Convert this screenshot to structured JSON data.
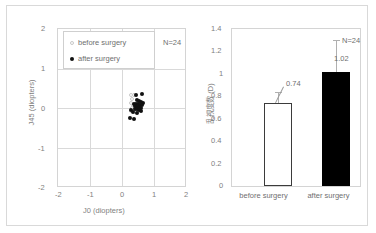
{
  "figure": {
    "border_color": "#d9d9d9"
  },
  "scatter": {
    "xlabel": "J0 (diopters)",
    "ylabel": "J45 (diopters)",
    "annotation": "N=24",
    "xticks": [
      "-2",
      "-1",
      "0",
      "1",
      "2"
    ],
    "yticks": [
      "2",
      "1",
      "0",
      "-1",
      "-2"
    ],
    "legend": [
      {
        "label": "before surgery",
        "marker": "open-circle-marker"
      },
      {
        "label": "after surgery",
        "marker": "filled-circle-marker"
      }
    ]
  },
  "bar": {
    "ylabel": "乱視度数 (D)",
    "yticks": [
      "1.4",
      "1.2",
      "1",
      "0.8",
      "0.6",
      "0.4",
      "0.2",
      "0"
    ],
    "annotation": "N=24",
    "categories": [
      "before surgery",
      "after surgery"
    ],
    "value_labels": [
      "0.74",
      "1.02"
    ]
  },
  "chart_data": [
    {
      "type": "scatter",
      "title": "",
      "xlabel": "J0 (diopters)",
      "ylabel": "J45 (diopters)",
      "xlim": [
        -2,
        2
      ],
      "ylim": [
        -2,
        2
      ],
      "xticks": [
        -2,
        -1,
        0,
        1,
        2
      ],
      "yticks": [
        -2,
        -1,
        0,
        1,
        2
      ],
      "grid": true,
      "legend_position": "upper-left",
      "annotations": [
        "N=24"
      ],
      "series": [
        {
          "name": "before surgery",
          "marker": "open-circle",
          "color": "#ffffff",
          "edge_color": "#c8c8c8",
          "points": [
            [
              0.3,
              0.33
            ],
            [
              0.38,
              0.33
            ],
            [
              0.33,
              0.22
            ],
            [
              0.3,
              0.11
            ],
            [
              0.36,
              0.05
            ],
            [
              0.42,
              0.02
            ],
            [
              0.34,
              -0.02
            ],
            [
              0.4,
              -0.06
            ],
            [
              0.3,
              -0.1
            ],
            [
              0.44,
              -0.12
            ]
          ]
        },
        {
          "name": "after surgery",
          "marker": "filled-circle",
          "color": "#111111",
          "points": [
            [
              0.46,
              0.31
            ],
            [
              0.63,
              0.34
            ],
            [
              0.48,
              0.18
            ],
            [
              0.55,
              0.17
            ],
            [
              0.6,
              0.14
            ],
            [
              0.67,
              0.12
            ],
            [
              0.4,
              0.1
            ],
            [
              0.46,
              0.09
            ],
            [
              0.52,
              0.08
            ],
            [
              0.58,
              0.07
            ],
            [
              0.64,
              0.06
            ],
            [
              0.44,
              0.03
            ],
            [
              0.5,
              0.02
            ],
            [
              0.56,
              0.01
            ],
            [
              0.62,
              0.0
            ],
            [
              0.42,
              -0.03
            ],
            [
              0.48,
              -0.05
            ],
            [
              0.54,
              -0.06
            ],
            [
              0.6,
              -0.08
            ],
            [
              0.3,
              -0.07
            ],
            [
              0.36,
              -0.12
            ],
            [
              0.5,
              -0.14
            ],
            [
              0.26,
              -0.27
            ],
            [
              0.38,
              -0.3
            ]
          ]
        }
      ]
    },
    {
      "type": "bar",
      "title": "",
      "xlabel": "",
      "ylabel": "乱視度数 (D)",
      "categories": [
        "before surgery",
        "after surgery"
      ],
      "values": [
        0.74,
        1.02
      ],
      "errors": [
        0.1,
        0.28
      ],
      "ylim": [
        0,
        1.4
      ],
      "yticks": [
        0,
        0.2,
        0.4,
        0.6,
        0.8,
        1.0,
        1.2,
        1.4
      ],
      "grid": false,
      "annotations": [
        "N=24"
      ],
      "bar_colors": [
        "#ffffff",
        "#000000"
      ],
      "bar_edge_colors": [
        "#3b3b3b",
        "#000000"
      ]
    }
  ]
}
